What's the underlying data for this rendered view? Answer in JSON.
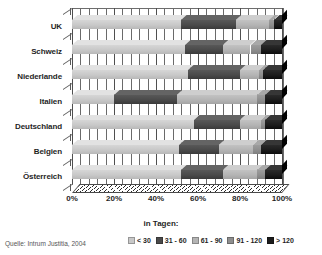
{
  "chart_data": {
    "type": "bar",
    "orientation": "horizontal",
    "stacked": true,
    "stacked_mode": "percent",
    "style": "3d",
    "title": "",
    "subtitle": "",
    "xlabel": "in Tagen:",
    "ylabel": "",
    "xlim": [
      0,
      100
    ],
    "grid": true,
    "grid_axis": "x",
    "legend_position": "bottom-right",
    "categories": [
      "UK",
      "Schweiz",
      "Niederlande",
      "Italien",
      "Deutschland",
      "Belgien",
      "Österreich"
    ],
    "category_order_top_to_bottom": [
      "UK",
      "Schweiz",
      "Niederlande",
      "Italien",
      "Deutschland",
      "Belgien",
      "Österreich"
    ],
    "xticks": [
      0,
      20,
      40,
      60,
      80,
      100
    ],
    "xticklabels": [
      "0%",
      "20%",
      "40%",
      "60%",
      "80%",
      "100%"
    ],
    "series": [
      {
        "name": "< 30",
        "color": "#c8c8c8",
        "values": [
          52,
          54,
          55,
          20,
          58,
          51,
          52
        ]
      },
      {
        "name": "31 - 60",
        "color": "#4a4a4a",
        "values": [
          26,
          18,
          25,
          30,
          22,
          19,
          20
        ]
      },
      {
        "name": "61 - 90",
        "color": "#b4b4b4",
        "values": [
          16,
          13,
          9,
          38,
          10,
          16,
          16
        ]
      },
      {
        "name": "91 - 120",
        "color": "#8e8e8e",
        "values": [
          2,
          5,
          2,
          4,
          2,
          4,
          4
        ]
      },
      {
        "name": "> 120",
        "color": "#1c1c1c",
        "values": [
          4,
          10,
          9,
          8,
          8,
          10,
          8
        ]
      }
    ],
    "source": "Quelle: Intrum Justitia, 2004"
  },
  "legend": {
    "items": [
      {
        "label": "< 30",
        "color": "#c8c8c8"
      },
      {
        "label": "31 - 60",
        "color": "#4a4a4a"
      },
      {
        "label": "61 - 90",
        "color": "#b4b4b4"
      },
      {
        "label": "91 - 120",
        "color": "#8e8e8e"
      },
      {
        "label": "> 120",
        "color": "#1c1c1c"
      }
    ]
  },
  "axis": {
    "x_title": "in Tagen:"
  },
  "footer": {
    "source": "Quelle: Intrum Justitia, 2004"
  }
}
